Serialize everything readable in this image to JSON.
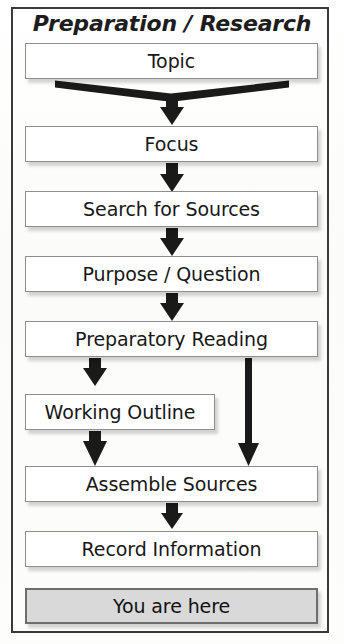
{
  "figure": {
    "title": "Preparation / Research",
    "type": "flowchart",
    "colors": {
      "frame_border": "#3a3a3a",
      "box_border": "#8e8e8e",
      "box_fill": "#ffffff",
      "highlight_fill": "#d9d9d9",
      "highlight_border": "#6e6e6e",
      "arrow": "#1a1a1a",
      "text": "#171717",
      "background": "#fcfcfb"
    }
  },
  "steps": [
    {
      "id": "topic",
      "label": "Topic"
    },
    {
      "id": "focus",
      "label": "Focus"
    },
    {
      "id": "search-for-sources",
      "label": "Search for Sources"
    },
    {
      "id": "purpose-question",
      "label": "Purpose / Question"
    },
    {
      "id": "preparatory-reading",
      "label": "Preparatory Reading"
    },
    {
      "id": "working-outline",
      "label": "Working Outline"
    },
    {
      "id": "assemble-sources",
      "label": "Assemble Sources"
    },
    {
      "id": "record-information",
      "label": "Record Information"
    }
  ],
  "legend": {
    "you_are_here": "You are here"
  },
  "connectors": [
    {
      "from": "topic",
      "to": "focus",
      "style": "wide-funnel"
    },
    {
      "from": "focus",
      "to": "search-for-sources",
      "style": "block-arrow"
    },
    {
      "from": "search-for-sources",
      "to": "purpose-question",
      "style": "block-arrow"
    },
    {
      "from": "purpose-question",
      "to": "preparatory-reading",
      "style": "block-arrow"
    },
    {
      "from": "preparatory-reading",
      "to": "working-outline",
      "style": "block-arrow"
    },
    {
      "from": "preparatory-reading",
      "to": "assemble-sources",
      "style": "long-thin-arrow"
    },
    {
      "from": "working-outline",
      "to": "assemble-sources",
      "style": "block-arrow"
    },
    {
      "from": "assemble-sources",
      "to": "record-information",
      "style": "block-arrow"
    }
  ]
}
